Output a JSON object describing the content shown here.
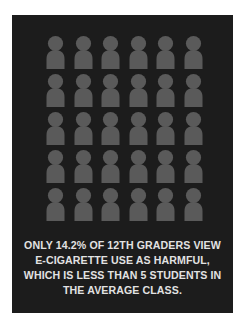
{
  "infographic": {
    "background_color": "#1c1c1c",
    "figure_color": "#5a5a5a",
    "text_color": "#e2e2e2",
    "icon": "person-icon",
    "rows": 5,
    "columns": 6,
    "figure_count": 30,
    "caption_lines": [
      "ONLY 14.2% OF 12TH GRADERS VIEW",
      "E-CIGARETTE USE AS HARMFUL,",
      "WHICH IS LESS THAN 5 STUDENTS IN",
      "THE AVERAGE CLASS."
    ]
  }
}
